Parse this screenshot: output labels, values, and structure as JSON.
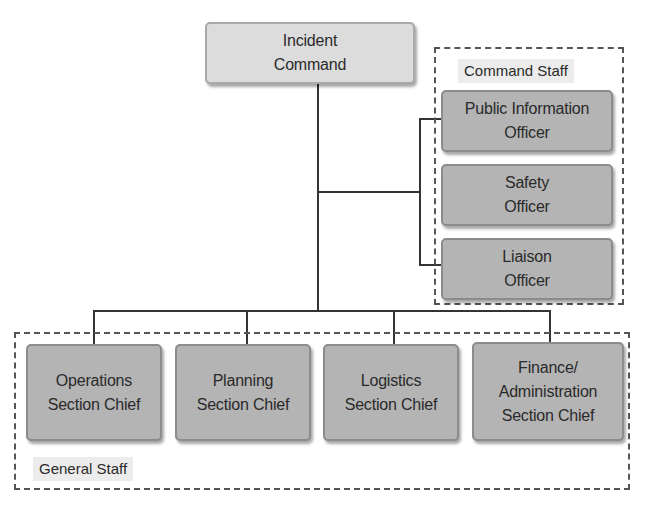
{
  "diagram": {
    "top": {
      "label": "Incident\nCommand"
    },
    "command_staff": {
      "group_label": "Command Staff",
      "members": [
        {
          "label": "Public Information\nOfficer"
        },
        {
          "label": "Safety\nOfficer"
        },
        {
          "label": "Liaison\nOfficer"
        }
      ]
    },
    "general_staff": {
      "group_label": "General Staff",
      "members": [
        {
          "label": "Operations\nSection Chief"
        },
        {
          "label": "Planning\nSection Chief"
        },
        {
          "label": "Logistics\nSection Chief"
        },
        {
          "label": "Finance/\nAdministration\nSection Chief"
        }
      ]
    }
  }
}
